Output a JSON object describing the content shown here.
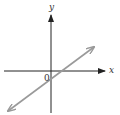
{
  "diagram": {
    "type": "coordinate-plane-line",
    "axes": {
      "x_label": "x",
      "y_label": "y",
      "origin_label": "0",
      "color": "#222222"
    },
    "line": {
      "color": "#9a9a9a",
      "description": "straight line with positive slope, arrows at both ends, crossing y-axis below origin and x-axis right of origin",
      "y_intercept_sign": "negative",
      "x_intercept_sign": "positive"
    }
  }
}
